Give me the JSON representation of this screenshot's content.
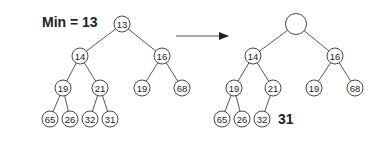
{
  "diagram": {
    "title": "Min = 13",
    "arrow": {
      "from": [
        176,
        36
      ],
      "to": [
        228,
        36
      ]
    },
    "left_tree": {
      "nodes": [
        {
          "id": "L0",
          "value": "13",
          "x": 122,
          "y": 24
        },
        {
          "id": "L1",
          "value": "14",
          "x": 80,
          "y": 56
        },
        {
          "id": "L2",
          "value": "16",
          "x": 162,
          "y": 56
        },
        {
          "id": "L3",
          "value": "19",
          "x": 63,
          "y": 88
        },
        {
          "id": "L4",
          "value": "21",
          "x": 100,
          "y": 88
        },
        {
          "id": "L5",
          "value": "19",
          "x": 142,
          "y": 88
        },
        {
          "id": "L6",
          "value": "68",
          "x": 182,
          "y": 88
        },
        {
          "id": "L7",
          "value": "65",
          "x": 50,
          "y": 119
        },
        {
          "id": "L8",
          "value": "26",
          "x": 70,
          "y": 119
        },
        {
          "id": "L9",
          "value": "32",
          "x": 90,
          "y": 119
        },
        {
          "id": "L10",
          "value": "31",
          "x": 110,
          "y": 119
        }
      ],
      "edges": [
        [
          "L0",
          "L1"
        ],
        [
          "L0",
          "L2"
        ],
        [
          "L1",
          "L3"
        ],
        [
          "L1",
          "L4"
        ],
        [
          "L2",
          "L5"
        ],
        [
          "L2",
          "L6"
        ],
        [
          "L3",
          "L7"
        ],
        [
          "L3",
          "L8"
        ],
        [
          "L4",
          "L9"
        ],
        [
          "L4",
          "L10"
        ]
      ]
    },
    "right_tree": {
      "nodes": [
        {
          "id": "R0",
          "value": "",
          "x": 296,
          "y": 24,
          "r": 10.5
        },
        {
          "id": "R1",
          "value": "14",
          "x": 253,
          "y": 56
        },
        {
          "id": "R2",
          "value": "16",
          "x": 335,
          "y": 56
        },
        {
          "id": "R3",
          "value": "19",
          "x": 234,
          "y": 88
        },
        {
          "id": "R4",
          "value": "21",
          "x": 273,
          "y": 88
        },
        {
          "id": "R5",
          "value": "19",
          "x": 314,
          "y": 88
        },
        {
          "id": "R6",
          "value": "68",
          "x": 355,
          "y": 88
        },
        {
          "id": "R7",
          "value": "65",
          "x": 222,
          "y": 119
        },
        {
          "id": "R8",
          "value": "26",
          "x": 242,
          "y": 119
        },
        {
          "id": "R9",
          "value": "32",
          "x": 262,
          "y": 119
        }
      ],
      "edges": [
        [
          "R0",
          "R1"
        ],
        [
          "R0",
          "R2"
        ],
        [
          "R1",
          "R3"
        ],
        [
          "R1",
          "R4"
        ],
        [
          "R2",
          "R5"
        ],
        [
          "R2",
          "R6"
        ],
        [
          "R3",
          "R7"
        ],
        [
          "R3",
          "R8"
        ],
        [
          "R4",
          "R9"
        ]
      ],
      "detached_value": {
        "value": "31",
        "x": 278,
        "y": 124
      }
    }
  }
}
